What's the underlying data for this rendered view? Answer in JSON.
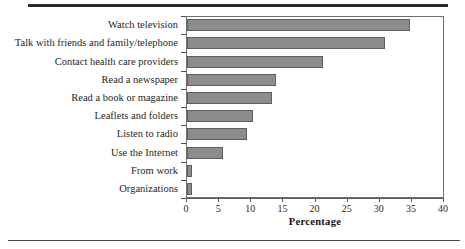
{
  "figure": {
    "axis_title": "Percentage",
    "bar_fill_color": "#8c8c8c",
    "bar_edge_color": "#5e5e5e",
    "frame_color": "#6f6f6f"
  },
  "chart_data": {
    "type": "bar",
    "orientation": "horizontal",
    "title": "",
    "subtitle": "",
    "xlabel": "Percentage",
    "ylabel": "",
    "xlim": [
      0,
      40
    ],
    "xticks": [
      0,
      5,
      10,
      15,
      20,
      25,
      30,
      35,
      40
    ],
    "xtick_labels": [
      "0",
      "5",
      "10",
      "15",
      "20",
      "25",
      "30",
      "35",
      "40"
    ],
    "grid": false,
    "legend": null,
    "categories": [
      "Watch television",
      "Talk with friends and family/telephone",
      "Contact health care providers",
      "Read a newspaper",
      "Read a book or magazine",
      "Leaflets and folders",
      "Listen to radio",
      "Use the Internet",
      "From work",
      "Organizations"
    ],
    "values": [
      34.7,
      30.8,
      21.2,
      13.8,
      13.3,
      10.2,
      9.4,
      5.6,
      0.8,
      0.8
    ],
    "series": [
      {
        "name": "Percentage",
        "values": [
          34.7,
          30.8,
          21.2,
          13.8,
          13.3,
          10.2,
          9.4,
          5.6,
          0.8,
          0.8
        ]
      }
    ]
  }
}
